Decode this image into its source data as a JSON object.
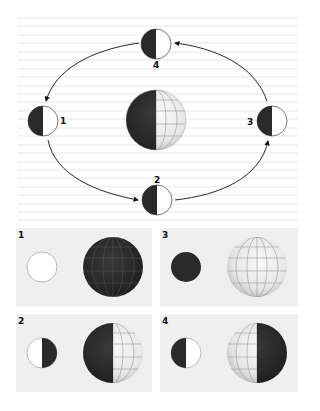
{
  "diagram": {
    "orbit_positions": [
      {
        "label": "1",
        "position": "left",
        "lit_side": "right"
      },
      {
        "label": "2",
        "position": "bottom",
        "lit_side": "right"
      },
      {
        "label": "3",
        "position": "right",
        "lit_side": "right"
      },
      {
        "label": "4",
        "position": "top",
        "lit_side": "right"
      }
    ],
    "earth": {
      "lit_side": "right"
    },
    "colors": {
      "dark": "#2a2a2a",
      "light": "#ffffff",
      "panel": "#efefef",
      "rule": "#d8d8d8"
    }
  },
  "panels": [
    {
      "label": "1",
      "moon": "full",
      "earth": "dark"
    },
    {
      "label": "3",
      "moon": "new",
      "earth": "lit"
    },
    {
      "label": "2",
      "moon": "left-lit-half",
      "earth": "left-dark"
    },
    {
      "label": "4",
      "moon": "right-lit-half",
      "earth": "right-dark"
    }
  ]
}
